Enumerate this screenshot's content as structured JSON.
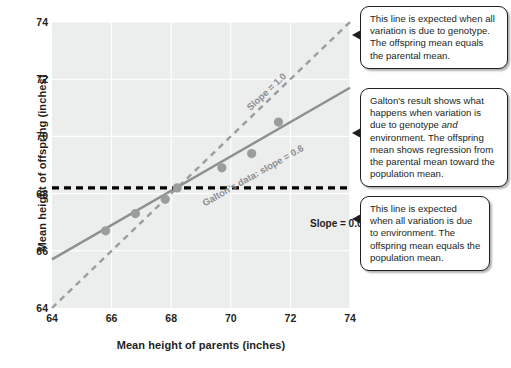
{
  "chart_data": {
    "type": "scatter",
    "title": "",
    "xlabel": "Mean height of parents (inches)",
    "ylabel": "Mean height of offspring (inches)",
    "xlim": [
      64,
      74
    ],
    "ylim": [
      64,
      74
    ],
    "xticks": [
      64,
      66,
      68,
      70,
      72,
      74
    ],
    "yticks": [
      64,
      66,
      68,
      70,
      72,
      74
    ],
    "grid": true,
    "legend_position": "none",
    "plot_background": "#eceded",
    "points": {
      "name": "Galton's data",
      "color": "#9a9c9e",
      "x": [
        65.8,
        66.8,
        67.8,
        68.2,
        69.7,
        70.7,
        71.6
      ],
      "y": [
        66.7,
        67.3,
        67.8,
        68.2,
        68.9,
        69.4,
        70.5
      ]
    },
    "series": [
      {
        "name": "Slope = 1.0",
        "style": "dashed",
        "color": "#9a9c9e",
        "slope": 1.0,
        "intercept": 0.0,
        "x": [
          64,
          74
        ],
        "y": [
          64,
          74
        ],
        "label": "Slope = 1.0"
      },
      {
        "name": "Galton's data: slope = 0.6",
        "style": "solid",
        "color": "#8d8f91",
        "slope": 0.6,
        "intercept": 27.3,
        "x": [
          64,
          74
        ],
        "y": [
          65.7,
          71.7
        ],
        "label": "Galton's data: slope = 0.6"
      },
      {
        "name": "Slope = 0.0",
        "style": "dashed",
        "color": "#000000",
        "slope": 0.0,
        "intercept": 68.2,
        "x": [
          64,
          74
        ],
        "y": [
          68.2,
          68.2
        ],
        "label": "Slope = 0.0"
      }
    ]
  },
  "annotations": {
    "genotype": {
      "text": "This line is expected when all variation is due to genotype. The offspring mean equals the parental mean."
    },
    "galton": {
      "part1": "Galton's result shows what happens when variation is due to genotype ",
      "emphasis": "and",
      "part2": " environment. The offspring mean shows regression from the parental mean toward the population mean."
    },
    "environment": {
      "text": "This line is expected when all variation is due to environment. The offspring mean equals the population mean."
    }
  }
}
